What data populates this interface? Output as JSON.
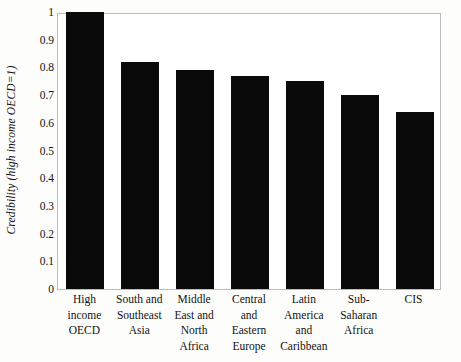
{
  "chart_data": {
    "type": "bar",
    "title": "",
    "xlabel": "",
    "ylabel": "Credibility (high income OECD=1)",
    "ylim": [
      0,
      1
    ],
    "ytick_labels": [
      "1",
      "0.9",
      "0.8",
      "0.7",
      "0.6",
      "0.5",
      "0.4",
      "0.3",
      "0.2",
      "0.1",
      "0"
    ],
    "ytick_values": [
      1,
      0.9,
      0.8,
      0.7,
      0.6,
      0.5,
      0.4,
      0.3,
      0.2,
      0.1,
      0
    ],
    "grid": false,
    "legend": "none",
    "bar_color": "#0a0a0a",
    "categories": [
      "High income OECD",
      "South and Southeast Asia",
      "Middle East and North Africa",
      "Central and Eastern Europe",
      "Latin America and Caribbean",
      "Sub-Saharan Africa",
      "CIS"
    ],
    "category_lines": [
      [
        "High",
        "income",
        "OECD"
      ],
      [
        "South and",
        "Southeast",
        "Asia"
      ],
      [
        "Middle",
        "East and",
        "North",
        "Africa"
      ],
      [
        "Central",
        "and",
        "Eastern",
        "Europe"
      ],
      [
        "Latin",
        "America",
        "and",
        "Caribbean"
      ],
      [
        "Sub-",
        "Saharan",
        "Africa"
      ],
      [
        "CIS"
      ]
    ],
    "values": [
      1.0,
      0.82,
      0.79,
      0.77,
      0.75,
      0.7,
      0.64
    ]
  }
}
